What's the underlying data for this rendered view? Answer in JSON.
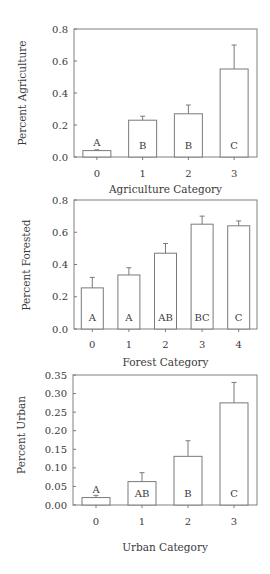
{
  "chart_data": [
    {
      "type": "bar",
      "title": "",
      "xlabel": "Agriculture Category",
      "ylabel": "Percent Agriculture",
      "categories": [
        "0",
        "1",
        "2",
        "3"
      ],
      "values": [
        0.04,
        0.23,
        0.27,
        0.55
      ],
      "error_upper": [
        0.045,
        0.255,
        0.325,
        0.7
      ],
      "significance_labels": [
        "A",
        "B",
        "B",
        "C"
      ],
      "significance_label_position": [
        "above",
        "inside",
        "inside",
        "inside"
      ],
      "ylim": [
        0,
        0.8
      ],
      "yticks": [
        "0.0",
        "0.2",
        "0.4",
        "0.6",
        "0.8"
      ],
      "ytick_values": [
        0,
        0.2,
        0.4,
        0.6,
        0.8
      ],
      "grid": false,
      "legend": null
    },
    {
      "type": "bar",
      "title": "",
      "xlabel": "Forest Category",
      "ylabel": "Percent Forested",
      "categories": [
        "0",
        "1",
        "2",
        "3",
        "4"
      ],
      "values": [
        0.255,
        0.335,
        0.47,
        0.65,
        0.64
      ],
      "error_upper": [
        0.32,
        0.38,
        0.53,
        0.7,
        0.67
      ],
      "significance_labels": [
        "A",
        "A",
        "AB",
        "BC",
        "C"
      ],
      "significance_label_position": [
        "inside",
        "inside",
        "inside",
        "inside",
        "inside"
      ],
      "ylim": [
        0,
        0.8
      ],
      "yticks": [
        "0.0",
        "0.2",
        "0.4",
        "0.6",
        "0.8"
      ],
      "ytick_values": [
        0,
        0.2,
        0.4,
        0.6,
        0.8
      ],
      "grid": false,
      "legend": null
    },
    {
      "type": "bar",
      "title": "",
      "xlabel": "Urban Category",
      "ylabel": "Percent Urban",
      "categories": [
        "0",
        "1",
        "2",
        "3"
      ],
      "values": [
        0.02,
        0.063,
        0.131,
        0.275
      ],
      "error_upper": [
        0.026,
        0.087,
        0.173,
        0.33
      ],
      "significance_labels": [
        "A",
        "AB",
        "B",
        "C"
      ],
      "significance_label_position": [
        "above",
        "inside",
        "inside",
        "inside"
      ],
      "ylim": [
        0,
        0.35
      ],
      "yticks": [
        "0.00",
        "0.05",
        "0.10",
        "0.15",
        "0.20",
        "0.25",
        "0.30",
        "0.35"
      ],
      "ytick_values": [
        0,
        0.05,
        0.1,
        0.15,
        0.2,
        0.25,
        0.3,
        0.35
      ],
      "grid": false,
      "legend": null
    }
  ],
  "layout": [
    {
      "plot": {
        "left": 74,
        "right": 257,
        "top": 29,
        "bottom": 157
      },
      "xtick_y": 177,
      "xtitle_y": 193,
      "ytitle_x": 22,
      "ytitle_y": 93,
      "bar_width": 28
    },
    {
      "plot": {
        "left": 74,
        "right": 257,
        "top": 200,
        "bottom": 329
      },
      "xtick_y": 348,
      "xtitle_y": 366,
      "ytitle_x": 26,
      "ytitle_y": 265,
      "bar_width": 22
    },
    {
      "plot": {
        "left": 73,
        "right": 257,
        "top": 375,
        "bottom": 505
      },
      "xtick_y": 525,
      "xtitle_y": 551,
      "ytitle_x": 21,
      "ytitle_y": 435,
      "bar_width": 28
    }
  ]
}
